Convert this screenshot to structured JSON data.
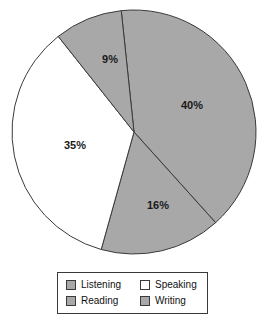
{
  "chart_data": {
    "type": "pie",
    "title": "",
    "labels": [
      "Listening",
      "Speaking",
      "Reading",
      "Writing"
    ],
    "categories": [
      "Listening",
      "Speaking",
      "Reading",
      "Writing"
    ],
    "values": [
      40,
      35,
      16,
      9
    ],
    "value_labels": [
      "40%",
      "35%",
      "16%",
      "9%"
    ],
    "legend_position": "bottom",
    "grid": false,
    "slices": [
      {
        "name": "Listening",
        "value": 40,
        "label": "40%",
        "color": "#a8a8a8",
        "label_x": 192,
        "label_y": 106
      },
      {
        "name": "Writing",
        "value": 16,
        "label": "16%",
        "color": "#a8a8a8",
        "label_x": 158,
        "label_y": 206
      },
      {
        "name": "Speaking",
        "value": 35,
        "label": "35%",
        "color": "#ffffff",
        "label_x": 75,
        "label_y": 146
      },
      {
        "name": "Reading",
        "value": 9,
        "label": "9%",
        "color": "#a8a8a8",
        "label_x": 110,
        "label_y": 60
      }
    ],
    "geometry": {
      "center_x": 134,
      "center_y": 132,
      "radius": 122,
      "start_angle_deg": -6
    },
    "colors": {
      "slice_gray": "#a8a8a8",
      "slice_white": "#ffffff",
      "outline": "#3a3a3a",
      "label_text": "#1a1a1a"
    }
  },
  "legend": {
    "entries": [
      {
        "label": "Listening",
        "swatch_color": "#a8a8a8"
      },
      {
        "label": "Speaking",
        "swatch_color": "#ffffff"
      },
      {
        "label": "Reading",
        "swatch_color": "#a8a8a8"
      },
      {
        "label": "Writing",
        "swatch_color": "#a8a8a8"
      }
    ]
  }
}
